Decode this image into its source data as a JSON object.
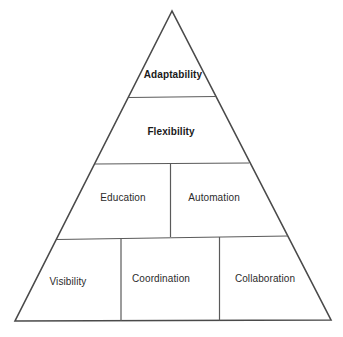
{
  "diagram": {
    "type": "pyramid",
    "colors": {
      "background": "#ffffff",
      "line": "#4a4a4a",
      "text": "#2b2b2b"
    },
    "tiers": [
      {
        "level": 1,
        "cells": [
          {
            "label": "Adaptability",
            "bold": true
          }
        ]
      },
      {
        "level": 2,
        "cells": [
          {
            "label": "Flexibility",
            "bold": true
          }
        ]
      },
      {
        "level": 3,
        "cells": [
          {
            "label": "Education",
            "bold": false
          },
          {
            "label": "Automation",
            "bold": false
          }
        ]
      },
      {
        "level": 4,
        "cells": [
          {
            "label": "Visibility",
            "bold": false
          },
          {
            "label": "Coordination",
            "bold": false
          },
          {
            "label": "Collaboration",
            "bold": false
          }
        ]
      }
    ]
  }
}
